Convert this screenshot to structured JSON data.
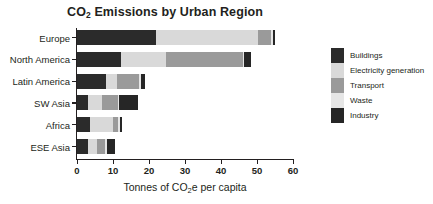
{
  "chart_data": {
    "type": "bar",
    "orientation": "horizontal",
    "stacked": true,
    "title": "CO2 Emissions by Urban Region",
    "title_main": "CO",
    "title_sub": "2",
    "title_rest": " Emissions by Urban Region",
    "xlabel_pre": "Tonnes of CO",
    "xlabel_sub": "2",
    "xlabel_post": "e per capita",
    "xlabel": "Tonnes of CO2e per capita",
    "ylabel": "",
    "categories": [
      "Europe",
      "North America",
      "Latin America",
      "SW Asia",
      "Africa",
      "ESE Asia"
    ],
    "series": [
      {
        "name": "Buildings",
        "color": "#2b2b2b",
        "values": [
          22.0,
          12.3,
          8.0,
          3.0,
          3.6,
          3.1
        ]
      },
      {
        "name": "Electricity generation",
        "color": "#d9d9d9",
        "values": [
          28.3,
          12.5,
          3.2,
          4.0,
          6.3,
          2.4
        ]
      },
      {
        "name": "Transport",
        "color": "#9a9a9a",
        "values": [
          3.6,
          21.3,
          6.1,
          4.5,
          1.4,
          2.4
        ]
      },
      {
        "name": "Waste",
        "color": "#e6e6e6",
        "values": [
          0.5,
          0.4,
          0.6,
          0.3,
          0.6,
          0.3
        ]
      },
      {
        "name": "Industry",
        "color": "#262626",
        "values": [
          0.7,
          1.7,
          0.9,
          5.2,
          0.7,
          2.4
        ]
      }
    ],
    "xticks": [
      0,
      10,
      20,
      30,
      40,
      50,
      60
    ],
    "xtick_labels": [
      "0",
      "10",
      "20",
      "30",
      "40",
      "50",
      "60"
    ],
    "xlim": [
      0,
      60
    ],
    "grid": false,
    "legend_position": "right",
    "legend_entries": [
      "Buildings",
      "Electricity generation",
      "Transport",
      "Waste",
      "Industry"
    ]
  }
}
